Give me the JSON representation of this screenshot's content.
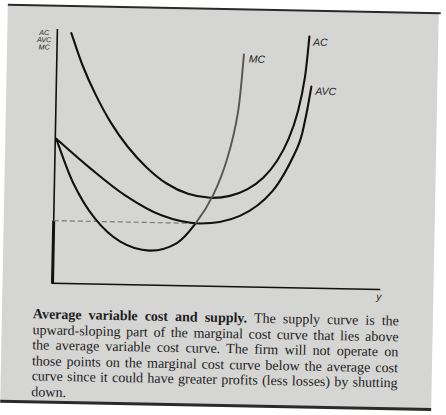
{
  "figure": {
    "y_axis_label_lines": [
      "AC",
      "AVC",
      "MC"
    ],
    "x_axis_label": "y",
    "curve_labels": {
      "ac": "AC",
      "avc": "AVC",
      "mc": "MC"
    }
  },
  "caption": {
    "title": "Average variable cost and supply.",
    "line1_rest": "The supply curve is the",
    "lines": [
      "upward-sloping part of the marginal cost curve that lies above",
      "the average variable cost curve. The firm will not operate on",
      "those points on the marginal cost curve below the average cost",
      "curve since it could have greater profits (less losses) by shutting",
      "down."
    ]
  },
  "colors": {
    "page_background": "#d5d5d3",
    "curve": "#111111",
    "supply_curve": "#555555",
    "dashed_line": "#7a7a7a",
    "rule": "#2a2a2a",
    "text": "#1d1d1d"
  },
  "chart_data": {
    "type": "line",
    "title": "Average variable cost and supply",
    "xlabel": "y",
    "ylabel": "AC AVC MC",
    "xlim": [
      0,
      100
    ],
    "ylim": [
      0,
      100
    ],
    "axis_units": "arbitrary (no ticks or numeric labels shown)",
    "grid": false,
    "legend": "none (curves labeled at their upper ends)",
    "series": [
      {
        "name": "AC",
        "style": "solid",
        "x": [
          4.3,
          7.8,
          12.0,
          16.8,
          22.2,
          28.1,
          34.3,
          40.9,
          47.7,
          53.7,
          59.1,
          63.9,
          68.0,
          71.4,
          74.1,
          76.0,
          77.1
        ],
        "y": [
          98.8,
          86.5,
          74.9,
          64.0,
          54.4,
          46.4,
          40.2,
          36.3,
          34.9,
          35.8,
          38.6,
          43.3,
          50.1,
          58.9,
          70.0,
          83.4,
          99.2
        ]
      },
      {
        "name": "AVC",
        "style": "solid",
        "x": [
          0.3,
          10.9,
          21.7,
          32.9,
          44.6,
          56.9,
          66.7,
          74.0,
          76.3,
          78.0
        ],
        "y": [
          57.0,
          45.6,
          35.2,
          27.6,
          24.7,
          28.0,
          38.0,
          55.1,
          66.4,
          79.5
        ]
      },
      {
        "name": "MC",
        "style": "solid",
        "supply_segment_start_index": 6,
        "x": [
          0.3,
          5.7,
          12.5,
          20.5,
          29.4,
          37.8,
          43.4,
          48.6,
          52.7,
          55.7,
          57.2
        ],
        "y": [
          57.0,
          39.8,
          26.0,
          16.9,
          13.6,
          16.8,
          24.7,
          36.0,
          50.5,
          68.8,
          91.7
        ]
      }
    ],
    "annotations": [
      {
        "type": "dashed-horizontal-line",
        "y": 24.7,
        "x_from": 0,
        "x_to": 43.4
      },
      {
        "type": "thick-vertical-axis-segment",
        "x": 0,
        "y_from": 0,
        "y_to": 24.7
      }
    ]
  }
}
